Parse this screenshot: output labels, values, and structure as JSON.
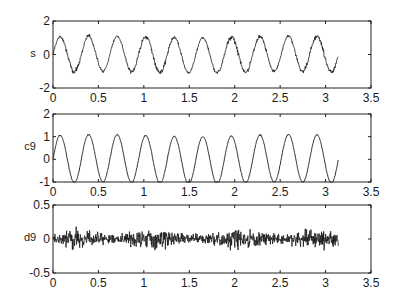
{
  "figure": {
    "panels": [
      {
        "id": "s",
        "ylabel": "s",
        "ylim": [
          -2,
          2
        ],
        "yticks": [
          "2",
          "0",
          "-2"
        ],
        "ytick_values": [
          2,
          0,
          -2
        ]
      },
      {
        "id": "c9",
        "ylabel": "c9",
        "ylim": [
          -1,
          2
        ],
        "yticks": [
          "2",
          "1",
          "0",
          "-1"
        ],
        "ytick_values": [
          2,
          1,
          0,
          -1
        ]
      },
      {
        "id": "d9",
        "ylabel": "d9",
        "ylim": [
          -0.5,
          0.5
        ],
        "yticks": [
          "0.5",
          "0",
          "-0.5"
        ],
        "ytick_values": [
          0.5,
          0,
          -0.5
        ]
      }
    ],
    "xticks": [
      "0",
      "0.5",
      "1",
      "1.5",
      "2",
      "2.5",
      "3",
      "3.5"
    ],
    "line_color": "#1a1a1a"
  },
  "chart_data": [
    {
      "type": "line",
      "title": "",
      "xlabel": "",
      "ylabel": "s",
      "xlim": [
        0,
        3.5
      ],
      "ylim": [
        -2,
        2
      ],
      "grid": false,
      "description": "Noisy sinusoid, ~10 cycles over t in [0, 3.14], amplitude ~1.2 with high-frequency noise",
      "x_range": [
        0,
        3.14
      ],
      "series": [
        {
          "name": "s",
          "model": "1.05*sin(20t) + noise(0.15)",
          "amplitude": 1.2,
          "period": 0.314
        }
      ]
    },
    {
      "type": "line",
      "title": "",
      "xlabel": "",
      "ylabel": "c9",
      "xlim": [
        0,
        3.5
      ],
      "ylim": [
        -1,
        2
      ],
      "grid": false,
      "description": "Smoothed approximation (level-9 approximation coefficients) of s; clean sinusoid ~10 cycles, peaks ~1.3, troughs ~-0.8",
      "x_range": [
        0,
        3.14
      ],
      "series": [
        {
          "name": "c9",
          "model": "1.05*sin(20t) + small noise",
          "amplitude": 1.05,
          "period": 0.314
        }
      ]
    },
    {
      "type": "line",
      "title": "",
      "xlabel": "",
      "ylabel": "d9",
      "xlim": [
        0,
        3.5
      ],
      "ylim": [
        -0.5,
        0.5
      ],
      "grid": false,
      "description": "Detail (noise) component, zero-mean, amplitude ~±0.2",
      "x_range": [
        0,
        3.14
      ],
      "series": [
        {
          "name": "d9",
          "model": "noise",
          "amplitude": 0.2
        }
      ]
    }
  ]
}
